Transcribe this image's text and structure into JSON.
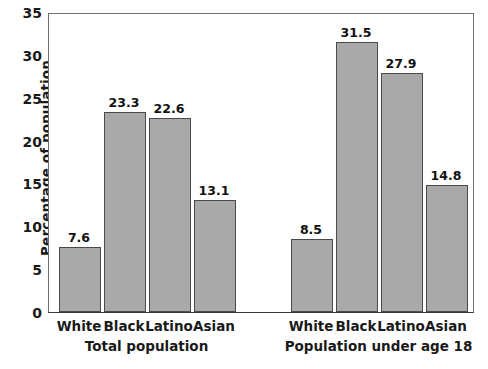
{
  "chart_data": {
    "type": "bar",
    "title": "",
    "xlabel": "",
    "ylabel": "Percentage of population",
    "ylim": [
      0,
      35
    ],
    "yticks": [
      0,
      5,
      10,
      15,
      20,
      25,
      30,
      35
    ],
    "ytick_labels": [
      "0",
      "5",
      "10",
      "15",
      "20",
      "25",
      "30",
      "35"
    ],
    "grid": false,
    "legend": "none",
    "bar_color": "#a9a9a9",
    "bar_edge_color": "#4a4a4a",
    "categories": [
      "White",
      "Black",
      "Latino",
      "Asian"
    ],
    "groups": [
      {
        "name": "Total population",
        "categories": [
          "White",
          "Black",
          "Latino",
          "Asian"
        ],
        "values": [
          7.6,
          23.3,
          22.6,
          13.1
        ],
        "value_labels": [
          "7.6",
          "23.3",
          "22.6",
          "13.1"
        ]
      },
      {
        "name": "Population under age 18",
        "categories": [
          "White",
          "Black",
          "Latino",
          "Asian"
        ],
        "values": [
          8.5,
          31.5,
          27.9,
          14.8
        ],
        "value_labels": [
          "8.5",
          "31.5",
          "27.9",
          "14.8"
        ]
      }
    ]
  }
}
